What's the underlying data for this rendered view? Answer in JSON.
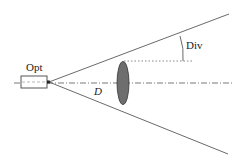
{
  "diagram": {
    "labels": {
      "source": "Opt",
      "divergence": "Div",
      "diameter": "D"
    },
    "colors": {
      "line": "#444444",
      "lens_fill": "#6e6e6e",
      "background": "#ffffff"
    },
    "elements": [
      {
        "name": "optical-source-box",
        "label": "Opt"
      },
      {
        "name": "optical-axis",
        "style": "dash-dot"
      },
      {
        "name": "upper-beam-ray"
      },
      {
        "name": "lower-beam-ray"
      },
      {
        "name": "lens",
        "shape": "ellipse"
      },
      {
        "name": "reference-line",
        "style": "dotted"
      },
      {
        "name": "divergence-angle-arc",
        "label": "Div"
      },
      {
        "name": "diameter-label",
        "label": "D"
      }
    ]
  }
}
